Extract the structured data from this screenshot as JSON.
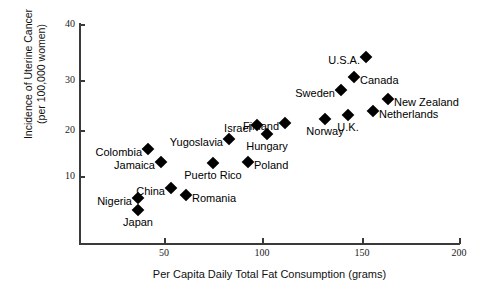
{
  "chart_data": {
    "type": "scatter",
    "title": "",
    "xlabel": "Per Capita Daily Total Fat Consumption (grams)",
    "ylabel_line1": "Incidence of Uterine Cancer",
    "ylabel_line2": "(per 100,000 women)",
    "xlim": [
      15,
      200
    ],
    "ylim": [
      -4,
      40
    ],
    "xticks": [
      50,
      100,
      150,
      200
    ],
    "yticks": [
      10,
      20,
      30,
      40
    ],
    "grid": false,
    "legend": "none",
    "marker": "filled-diamond",
    "marker_color": "#000000",
    "points": [
      {
        "label": "Japan",
        "x": 38,
        "y": 3,
        "px": 138,
        "py": 210,
        "label_pos": "below"
      },
      {
        "label": "Nigeria",
        "x": 38,
        "y": 5,
        "px": 138,
        "py": 198,
        "label_pos": "left"
      },
      {
        "label": "Colombia",
        "x": 43,
        "y": 16,
        "px": 148,
        "py": 149,
        "label_pos": "left"
      },
      {
        "label": "Jamaica",
        "x": 49,
        "y": 13.5,
        "px": 161,
        "py": 162,
        "label_pos": "left"
      },
      {
        "label": "China",
        "x": 54,
        "y": 8.5,
        "px": 171,
        "py": 188,
        "label_pos": "left"
      },
      {
        "label": "Romania",
        "x": 62,
        "y": 7,
        "px": 186,
        "py": 195,
        "label_pos": "right"
      },
      {
        "label": "Puerto Rico",
        "x": 75,
        "y": 12.5,
        "px": 213,
        "py": 163,
        "label_pos": "below"
      },
      {
        "label": "Yugoslavia",
        "x": 83,
        "y": 18,
        "px": 229,
        "py": 139,
        "label_pos": "left"
      },
      {
        "label": "Poland",
        "x": 93,
        "y": 13,
        "px": 248,
        "py": 162,
        "label_pos": "right"
      },
      {
        "label": "Israel",
        "x": 98,
        "y": 20.5,
        "px": 257,
        "py": 125,
        "label_pos": "left"
      },
      {
        "label": "Hungary",
        "x": 103,
        "y": 18.5,
        "px": 267,
        "py": 134,
        "label_pos": "below"
      },
      {
        "label": "Finland",
        "x": 112,
        "y": 21,
        "px": 285,
        "py": 123,
        "label_pos": "left"
      },
      {
        "label": "Norway",
        "x": 132,
        "y": 22,
        "px": 325,
        "py": 119,
        "label_pos": "below"
      },
      {
        "label": "U.K.",
        "x": 143,
        "y": 23,
        "px": 348,
        "py": 115,
        "label_pos": "below"
      },
      {
        "label": "Sweden",
        "x": 139,
        "y": 27,
        "px": 341,
        "py": 90,
        "label_pos": "left"
      },
      {
        "label": "Canada",
        "x": 146,
        "y": 30,
        "px": 354,
        "py": 77,
        "label_pos": "right"
      },
      {
        "label": "U.S.A.",
        "x": 151,
        "y": 34.5,
        "px": 366,
        "py": 57,
        "label_pos": "left"
      },
      {
        "label": "Netherlands",
        "x": 155,
        "y": 23.5,
        "px": 373,
        "py": 111,
        "label_pos": "right"
      },
      {
        "label": "New Zealand",
        "x": 163,
        "y": 26,
        "px": 388,
        "py": 99,
        "label_pos": "right"
      }
    ]
  },
  "axes": {
    "y_ticks": [
      {
        "value": "40",
        "py": 24
      },
      {
        "value": "30",
        "py": 80
      },
      {
        "value": "20",
        "py": 130
      },
      {
        "value": "10",
        "py": 176
      }
    ],
    "x_ticks": [
      {
        "value": "50",
        "px": 164
      },
      {
        "value": "100",
        "px": 262
      },
      {
        "value": "150",
        "px": 362
      },
      {
        "value": "200",
        "px": 459
      }
    ],
    "axis_color": "#3a3a3a"
  }
}
